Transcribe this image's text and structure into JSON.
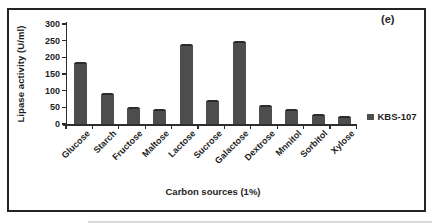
{
  "figure": {
    "panel_label": "(e)",
    "legend": {
      "label": "KBS-107",
      "marker_color": "#4d4d4d"
    }
  },
  "chart_data": {
    "type": "bar",
    "title": "",
    "xlabel": "Carbon sources (1%)",
    "ylabel": "Lipase activity (U/ml)",
    "ylim": [
      0,
      300
    ],
    "yticks": [
      0,
      50,
      100,
      150,
      200,
      250,
      300
    ],
    "grid": false,
    "legend_position": "right",
    "bar_color": "#4d4d4d",
    "categories": [
      "Glucose",
      "Starch",
      "Fructose",
      "Maltose",
      "Lactose",
      "Sucrose",
      "Galactose",
      "Dextrose",
      "Mnnitol",
      "Sorbitol",
      "Xylose"
    ],
    "series": [
      {
        "name": "KBS-107",
        "color": "#4d4d4d",
        "values": [
          187,
          94,
          52,
          46,
          239,
          72,
          250,
          57,
          46,
          30,
          23
        ]
      }
    ],
    "panel_label": "(e)"
  }
}
